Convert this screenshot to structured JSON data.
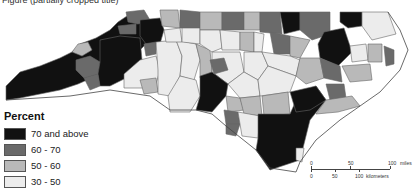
{
  "header": {
    "cut_text": "Figure (partially cropped title)"
  },
  "legend": {
    "title": "Percent",
    "items": [
      {
        "label": "70 and above",
        "color": "#111111"
      },
      {
        "label": "60 - 70",
        "color": "#6a6a6a"
      },
      {
        "label": "50 - 60",
        "color": "#b9b9b9"
      },
      {
        "label": "30 - 50",
        "color": "#ececec"
      }
    ]
  },
  "scale": {
    "miles": {
      "labels": [
        "0",
        "50",
        "100"
      ],
      "unit": "miles"
    },
    "kilometers": {
      "labels": [
        "0",
        "50",
        "100"
      ],
      "unit": "kilometers"
    }
  },
  "map": {
    "region": "North Carolina counties",
    "border_color": "#555555"
  }
}
